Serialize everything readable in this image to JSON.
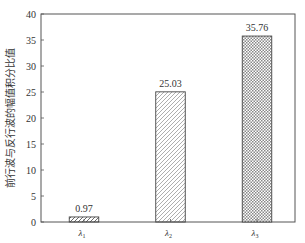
{
  "chart_data": {
    "type": "bar",
    "title": "",
    "xlabel": "",
    "ylabel": "前行波与反行波的幅值积分比值",
    "categories": [
      "λ1",
      "λ2",
      "λ3"
    ],
    "category_display": [
      {
        "base": "λ",
        "sub": "1"
      },
      {
        "base": "λ",
        "sub": "2"
      },
      {
        "base": "λ",
        "sub": "3"
      }
    ],
    "values": [
      0.97,
      25.03,
      35.76
    ],
    "value_labels": [
      "0.97",
      "25.03",
      "35.76"
    ],
    "patterns": [
      "diagonal-hatch-back",
      "diagonal-hatch-forward",
      "crosshatch"
    ],
    "ylim": [
      0,
      40
    ],
    "yticks": [
      0,
      5,
      10,
      15,
      20,
      25,
      30,
      35,
      40
    ],
    "ytick_labels": [
      "0",
      "5",
      "10",
      "15",
      "20",
      "25",
      "30",
      "35",
      "40"
    ],
    "grid": false,
    "legend": null
  }
}
